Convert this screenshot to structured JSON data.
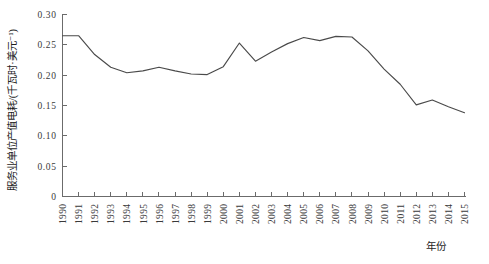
{
  "chart_data": {
    "type": "line",
    "title": "",
    "xlabel": "年份",
    "ylabel": "服务业单位产值电耗/(千瓦时·美元⁻¹)",
    "xlim": [
      1990,
      2015
    ],
    "ylim": [
      0,
      0.3
    ],
    "grid": false,
    "legend": "none",
    "yticks": [
      "0",
      "0.05",
      "0.10",
      "0.15",
      "0.20",
      "0.25",
      "0.30"
    ],
    "ytick_values": [
      0,
      0.05,
      0.1,
      0.15,
      0.2,
      0.25,
      0.3
    ],
    "categories": [
      "1990",
      "1991",
      "1992",
      "1993",
      "1994",
      "1995",
      "1996",
      "1997",
      "1998",
      "1999",
      "2000",
      "2001",
      "2002",
      "2003",
      "2004",
      "2005",
      "2006",
      "2007",
      "2008",
      "2009",
      "2010",
      "2011",
      "2012",
      "2013",
      "2014",
      "2015"
    ],
    "x": [
      1990,
      1991,
      1992,
      1993,
      1994,
      1995,
      1996,
      1997,
      1998,
      1999,
      2000,
      2001,
      2002,
      2003,
      2004,
      2005,
      2006,
      2007,
      2008,
      2009,
      2010,
      2011,
      2012,
      2013,
      2014,
      2015
    ],
    "values": [
      0.265,
      0.265,
      0.234,
      0.213,
      0.204,
      0.207,
      0.213,
      0.207,
      0.202,
      0.201,
      0.214,
      0.253,
      0.223,
      0.238,
      0.252,
      0.262,
      0.257,
      0.264,
      0.263,
      0.24,
      0.21,
      0.185,
      0.151,
      0.159,
      0.148,
      0.138
    ],
    "series": [
      {
        "name": "服务业单位产值电耗",
        "color": "#4a4a4a",
        "values": [
          0.265,
          0.265,
          0.234,
          0.213,
          0.204,
          0.207,
          0.213,
          0.207,
          0.202,
          0.201,
          0.214,
          0.253,
          0.223,
          0.238,
          0.252,
          0.262,
          0.257,
          0.264,
          0.263,
          0.24,
          0.21,
          0.185,
          0.151,
          0.159,
          0.148,
          0.138
        ]
      }
    ],
    "axis_color": "#6b6b6b",
    "line_color": "#4a4a4a"
  }
}
